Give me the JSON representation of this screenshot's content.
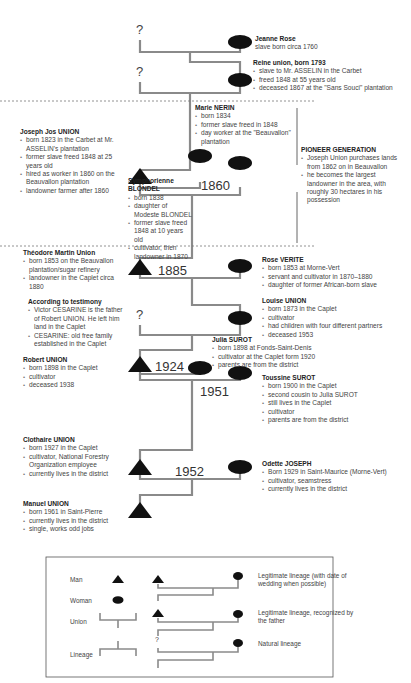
{
  "diagram": {
    "colors": {
      "line": "#8a8a8a",
      "symbol": "#111111",
      "dash": "#777777",
      "text": "#444444"
    },
    "persons": [
      {
        "id": "jeanne-rose",
        "name": "Jeanne Rose",
        "sex": "woman",
        "details": [
          "slave born circa 1760"
        ]
      },
      {
        "id": "reine-union",
        "name": "Reine union, born 1793",
        "sex": "woman",
        "details": [
          "slave to Mr. ASSELIN in the Carbet",
          "freed 1848 at 55 years old",
          "deceased 1867 at the \"Sans Souci\" plantation"
        ]
      },
      {
        "id": "marie-nerin",
        "name": "Marie NERIN",
        "sex": "woman",
        "details": [
          "born 1834",
          "former slave freed in 1848",
          "day worker at the \"Beauvallon\" plantation"
        ]
      },
      {
        "id": "joseph-jos-union",
        "name": "Joseph Jos UNION",
        "sex": "man",
        "details": [
          "born 1823 in the Carbet at Mr. ASSELIN's plantation",
          "former slave freed 1848 at 25 years old",
          "hired as worker in 1860 on the Beauvallon plantation",
          "landowner farmer after 1860"
        ]
      },
      {
        "id": "symphorienne-blondel",
        "name": "Symphorienne BLONDEL",
        "sex": "woman",
        "details": [
          "born 1838",
          "daughter of Modeste BLONDEL",
          "former slave freed 1848 at 10 years old",
          "cultivator, then landowner in 1870"
        ]
      },
      {
        "id": "theodore-martin-union",
        "name": "Théodore Martin Union",
        "sex": "man",
        "details": [
          "born 1853 on the Beauvallon plantation/sugar refinery",
          "landowner in the Caplet circa 1880"
        ]
      },
      {
        "id": "rose-verite",
        "name": "Rose VERITE",
        "sex": "woman",
        "details": [
          "born 1853 at Morne-Vert",
          "servant and cultivator in 1870–1880",
          "daughter of former African-born slave"
        ]
      },
      {
        "id": "louise-union",
        "name": "Louise UNION",
        "sex": "woman",
        "details": [
          "born 1873 in the Caplet",
          "cultivator",
          "had children with four different partners",
          "deceased 1953"
        ]
      },
      {
        "id": "julia-surot",
        "name": "Julia SUROT",
        "sex": "woman",
        "details": [
          "born 1898 at Fonds-Saint-Denis",
          "cultivator at the Caplet form 1920",
          "parents are from the district"
        ]
      },
      {
        "id": "robert-union",
        "name": "Robert UNION",
        "sex": "man",
        "details": [
          "born 1898 in the Caplet",
          "cultivator",
          "deceased 1938"
        ]
      },
      {
        "id": "toussine-surot",
        "name": "Toussine SUROT",
        "sex": "woman",
        "details": [
          "born 1900 in the Caplet",
          "second cousin to Julia SUROT",
          "still lives in the Caplet",
          "cultivator",
          "parents are from the district"
        ]
      },
      {
        "id": "clothaire-union",
        "name": "Clothaire UNION",
        "sex": "man",
        "details": [
          "born 1927 in the Caplet",
          "cultivator, National Forestry Organization employee",
          "currently lives in the district"
        ]
      },
      {
        "id": "odette-joseph",
        "name": "Odette JOSEPH",
        "sex": "woman",
        "details": [
          "Born 1929 in Saint-Maurice (Morne-Vert)",
          "cultivator, seamstress",
          "currently lives in the district"
        ]
      },
      {
        "id": "manuel-union",
        "name": "Manuel UNION",
        "sex": "man",
        "details": [
          "born 1961 in Saint-Pierre",
          "currently lives in the district",
          "single, works odd jobs"
        ]
      }
    ],
    "testimony": {
      "title": "According to testimony",
      "details": [
        "Victor CESARINE is the father of Robert UNION. He left him land in the Caplet",
        "CESARINE:  old free family established in the Caplet"
      ]
    },
    "pioneer": {
      "title": "PIONEER GENERATION",
      "details": [
        "Joseph Union purchases lands from 1862 on in Beauvallon",
        "he becomes the largest landowner in the area, with roughly 30 hectares in his possession"
      ]
    },
    "years": [
      "1860",
      "1885",
      "1924",
      "1951",
      "1952"
    ],
    "unknown_mark": "?",
    "legend": {
      "man": "Man",
      "woman": "Woman",
      "union": "Union",
      "lineage": "Lineage",
      "legit_wedding": "Legitimate lineage (with date of wedding when possible)",
      "legit_recognized": "Legitimate lineage, recognized by the father",
      "natural": "Natural lineage"
    }
  }
}
